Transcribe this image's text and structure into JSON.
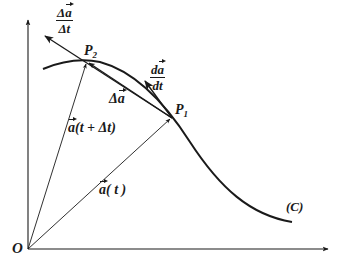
{
  "diagram": {
    "colors": {
      "stroke": "#1a1a1a",
      "background": "#ffffff"
    },
    "axes": {
      "origin_label": "O",
      "origin": [
        28,
        249
      ],
      "x_axis_end": [
        328,
        249
      ],
      "y_axis_end": [
        28,
        20
      ]
    },
    "curve": {
      "label": "(C)",
      "path": "M43,69 C60,62 80,58 100,62 C130,70 160,95 190,142 C220,188 250,215 292,222"
    },
    "points": {
      "P1": {
        "label_base": "P",
        "label_sub": "1",
        "xy": [
          172,
          118
        ]
      },
      "P2": {
        "label_base": "P",
        "label_sub": "2",
        "xy": [
          87,
          62
        ]
      }
    },
    "vectors": {
      "a_t": {
        "label_vec": "a",
        "label_rest": "( t )",
        "from": [
          28,
          249
        ],
        "to": [
          172,
          118
        ]
      },
      "a_t_dt": {
        "label_vec": "a",
        "label_rest": "(t + Δt)",
        "from": [
          28,
          249
        ],
        "to": [
          87,
          62
        ]
      },
      "delta_a": {
        "label_prefix": "Δ",
        "label_vec": "a",
        "from": [
          172,
          118
        ],
        "to": [
          87,
          62
        ]
      },
      "avg_rate": {
        "num_prefix": "Δ",
        "num_vec": "a",
        "den": "Δt",
        "from": [
          172,
          118
        ],
        "to": [
          45,
          36
        ]
      },
      "derivative": {
        "num_prefix": "d",
        "num_vec": "a",
        "den": "dt",
        "from": [
          172,
          118
        ],
        "to": [
          145,
          81
        ]
      }
    }
  }
}
